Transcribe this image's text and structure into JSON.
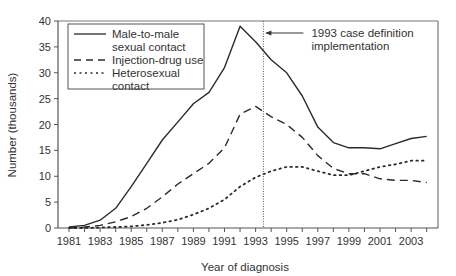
{
  "chart_data": {
    "type": "line",
    "title": "",
    "xlabel": "Year of diagnosis",
    "ylabel": "Number (thousands)",
    "ylim": [
      0,
      40
    ],
    "xlim": [
      1981,
      2004
    ],
    "yticks": [
      0,
      5,
      10,
      15,
      20,
      25,
      30,
      35,
      40
    ],
    "xtick_labels": [
      "1981",
      "1983",
      "1985",
      "1987",
      "1989",
      "1991",
      "1993",
      "1995",
      "1997",
      "1999",
      "2001",
      "2003"
    ],
    "grid": false,
    "legend_position": "upper left",
    "x": [
      1981,
      1982,
      1983,
      1984,
      1985,
      1986,
      1987,
      1988,
      1989,
      1990,
      1991,
      1992,
      1993,
      1994,
      1995,
      1996,
      1997,
      1998,
      1999,
      2000,
      2001,
      2002,
      2003,
      2004
    ],
    "series": [
      {
        "name": "Male-to-male sexual contact",
        "legend_lines": [
          "Male-to-male",
          "sexual contact"
        ],
        "style": "solid",
        "values": [
          0.2,
          0.5,
          1.5,
          3.8,
          8.0,
          12.5,
          17.0,
          20.5,
          24.0,
          26.2,
          31.0,
          39.0,
          36.0,
          32.5,
          30.0,
          25.5,
          19.5,
          16.5,
          15.5,
          15.5,
          15.3,
          16.3,
          17.3,
          17.7
        ]
      },
      {
        "name": "Injection-drug use",
        "legend_lines": [
          "Injection-drug use"
        ],
        "style": "dashed",
        "values": [
          0.0,
          0.2,
          0.5,
          1.2,
          2.2,
          3.8,
          6.0,
          8.5,
          10.5,
          12.5,
          15.5,
          22.0,
          23.5,
          21.5,
          20.0,
          17.5,
          14.0,
          11.5,
          10.5,
          10.5,
          9.5,
          9.2,
          9.2,
          8.8
        ]
      },
      {
        "name": "Heterosexual contact",
        "legend_lines": [
          "Heterosexual",
          "contact"
        ],
        "style": "dotted",
        "values": [
          0.0,
          0.0,
          0.1,
          0.2,
          0.3,
          0.6,
          1.0,
          1.6,
          2.6,
          3.8,
          5.5,
          8.0,
          9.8,
          11.0,
          11.8,
          11.8,
          11.0,
          10.2,
          10.2,
          11.0,
          11.8,
          12.3,
          13.0,
          13.0
        ]
      }
    ],
    "annotations": [
      {
        "text_lines": [
          "1993 case definition",
          "implementation"
        ],
        "x": 1993.5,
        "type": "vertical-dotted-line-with-arrow"
      }
    ]
  },
  "colors": {
    "line": "#2b2b2b",
    "axis": "#555555",
    "frame": "#777777"
  }
}
